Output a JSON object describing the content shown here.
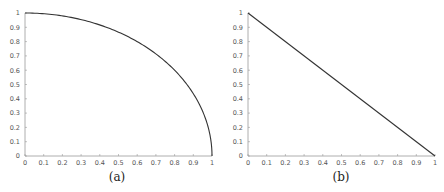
{
  "chart_data": [
    {
      "type": "line",
      "caption": "(a)",
      "title": "",
      "xlabel": "",
      "ylabel": "",
      "xlim": [
        0,
        1
      ],
      "ylim": [
        0,
        1
      ],
      "grid": false,
      "x_ticks": [
        "0",
        "0.1",
        "0.2",
        "0.3",
        "0.4",
        "0.5",
        "0.6",
        "0.7",
        "0.8",
        "0.9",
        "1"
      ],
      "y_ticks": [
        "0",
        "0.1",
        "0.2",
        "0.3",
        "0.4",
        "0.5",
        "0.6",
        "0.7",
        "0.8",
        "0.9",
        "1"
      ],
      "series": [
        {
          "name": "quarter circle y = sqrt(1 - x^2)",
          "x": [
            0,
            0.1,
            0.2,
            0.3,
            0.4,
            0.5,
            0.6,
            0.7,
            0.8,
            0.9,
            0.95,
            0.99,
            1
          ],
          "y": [
            1,
            0.995,
            0.98,
            0.954,
            0.917,
            0.866,
            0.8,
            0.714,
            0.6,
            0.436,
            0.312,
            0.141,
            0
          ]
        }
      ]
    },
    {
      "type": "line",
      "caption": "(b)",
      "title": "",
      "xlabel": "",
      "ylabel": "",
      "xlim": [
        0,
        1
      ],
      "ylim": [
        0,
        1
      ],
      "grid": false,
      "x_ticks": [
        "0",
        "0.1",
        "0.2",
        "0.3",
        "0.4",
        "0.5",
        "0.6",
        "0.7",
        "0.8",
        "0.9",
        "1"
      ],
      "y_ticks": [
        "0",
        "0.1",
        "0.2",
        "0.3",
        "0.4",
        "0.5",
        "0.6",
        "0.7",
        "0.8",
        "0.9",
        "1"
      ],
      "series": [
        {
          "name": "line y = 1 - x",
          "x": [
            0,
            0.5,
            1
          ],
          "y": [
            1,
            0.5,
            0
          ]
        }
      ]
    }
  ],
  "style": {
    "line_color": "#333333",
    "axis_color": "#999999",
    "tick_label_color": "#555555"
  }
}
